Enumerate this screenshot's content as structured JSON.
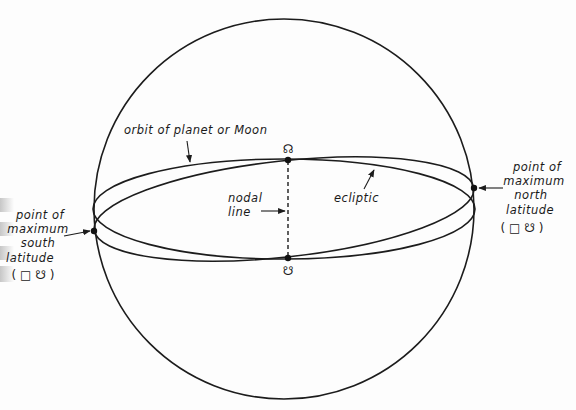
{
  "diagram": {
    "type": "celestial-sphere-nodes",
    "labels": {
      "orbit": "orbit of planet or Moon",
      "ecliptic": "ecliptic",
      "nodal_line": [
        "nodal",
        "line"
      ],
      "north_point": [
        "point of",
        "maximum",
        "north",
        "latitude",
        "( □ ☋ )"
      ],
      "south_point": [
        "point of",
        "maximum",
        "south",
        "latitude",
        "( □ ☋ )"
      ]
    },
    "symbols": {
      "ascending_node": "☊",
      "descending_node": "☋"
    },
    "colors": {
      "ink": "#1c1c1c",
      "background": "#fdfdfd"
    }
  }
}
